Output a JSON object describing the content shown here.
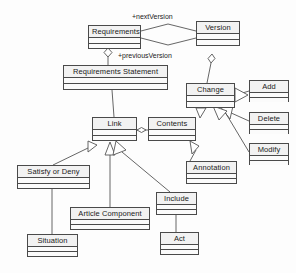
{
  "diagram": {
    "type": "uml-class-diagram",
    "background_color": "#fdfdfd",
    "line_color": "#4a4a4a",
    "text_color": "#1a1a1a",
    "classes": [
      {
        "id": "requirements",
        "name": "Requirements",
        "x": 88,
        "y": 25,
        "w": 53,
        "h": 24
      },
      {
        "id": "version",
        "name": "Version",
        "x": 196,
        "y": 21,
        "w": 44,
        "h": 25
      },
      {
        "id": "requirements-statement",
        "name": "Requirements Statement",
        "x": 63,
        "y": 65,
        "w": 105,
        "h": 25
      },
      {
        "id": "change",
        "name": "Change",
        "x": 186,
        "y": 83,
        "w": 49,
        "h": 25
      },
      {
        "id": "add",
        "name": "Add",
        "x": 249,
        "y": 80,
        "w": 40,
        "h": 22
      },
      {
        "id": "delete",
        "name": "Delete",
        "x": 249,
        "y": 112,
        "w": 40,
        "h": 22
      },
      {
        "id": "modify",
        "name": "Modify",
        "x": 249,
        "y": 143,
        "w": 40,
        "h": 22
      },
      {
        "id": "link",
        "name": "Link",
        "x": 92,
        "y": 117,
        "w": 45,
        "h": 24
      },
      {
        "id": "contents",
        "name": "Contents",
        "x": 148,
        "y": 117,
        "w": 48,
        "h": 24
      },
      {
        "id": "annotation",
        "name": "Annotation",
        "x": 186,
        "y": 161,
        "w": 51,
        "h": 23
      },
      {
        "id": "satisfy-or-deny",
        "name": "Satisfy or Deny",
        "x": 17,
        "y": 165,
        "w": 73,
        "h": 24
      },
      {
        "id": "include",
        "name": "Include",
        "x": 156,
        "y": 192,
        "w": 41,
        "h": 23
      },
      {
        "id": "article-component",
        "name": "Article Component",
        "x": 70,
        "y": 207,
        "w": 80,
        "h": 23
      },
      {
        "id": "situation",
        "name": "Situation",
        "x": 27,
        "y": 234,
        "w": 51,
        "h": 23
      },
      {
        "id": "act",
        "name": "Act",
        "x": 160,
        "y": 232,
        "w": 39,
        "h": 23
      }
    ],
    "edge_labels": [
      {
        "id": "next-version",
        "text": "+nextVersion",
        "x": 132,
        "y": 12
      },
      {
        "id": "previous-version",
        "text": "+previousVersion",
        "x": 118,
        "y": 51
      }
    ]
  }
}
